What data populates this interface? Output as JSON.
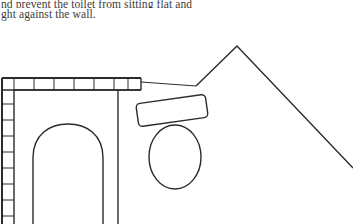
{
  "page": {
    "background_color": "#ffffff",
    "ink_color": "#2b2b2b",
    "text_color": "#3b3b3b",
    "width": 353,
    "height": 224
  },
  "body_text": {
    "lines": [
      {
        "id": "line-1",
        "text": "nd prevent the toilet from sitting flat and",
        "clipped": "top"
      },
      {
        "id": "line-2",
        "text": "ght against the wall.",
        "clipped": "left"
      }
    ]
  },
  "figure": {
    "caption": "",
    "elements": [
      {
        "name": "hatched-wall-top",
        "kind": "hatched-band",
        "orientation": "horizontal",
        "segments": 7
      },
      {
        "name": "hatched-wall-left",
        "kind": "hatched-band",
        "orientation": "vertical",
        "segments": 9
      },
      {
        "name": "toilet-arch-outline",
        "kind": "arch"
      },
      {
        "name": "partition-vertical-line",
        "kind": "line"
      },
      {
        "name": "tank-lid-rectangle",
        "kind": "rounded-rect",
        "rotation_deg": -8
      },
      {
        "name": "toilet-bowl-ellipse",
        "kind": "ellipse"
      },
      {
        "name": "roof-peak-chevron",
        "kind": "polyline"
      },
      {
        "name": "wall-edge-line",
        "kind": "line"
      }
    ]
  }
}
